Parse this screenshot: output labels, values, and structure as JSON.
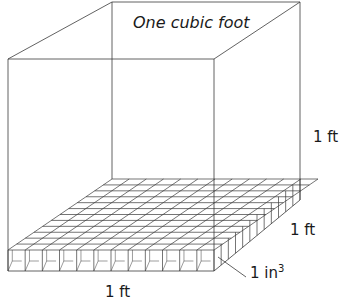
{
  "diagram": {
    "title": "One cubic foot",
    "labels": {
      "height": "1 ft",
      "depth": "1 ft",
      "width": "1 ft",
      "unit_cube": "1 in",
      "unit_cube_exp": "3"
    },
    "grid": {
      "rows": 12,
      "cols": 12
    },
    "colors": {
      "line": "#3a3a3a",
      "background": "#ffffff"
    }
  }
}
